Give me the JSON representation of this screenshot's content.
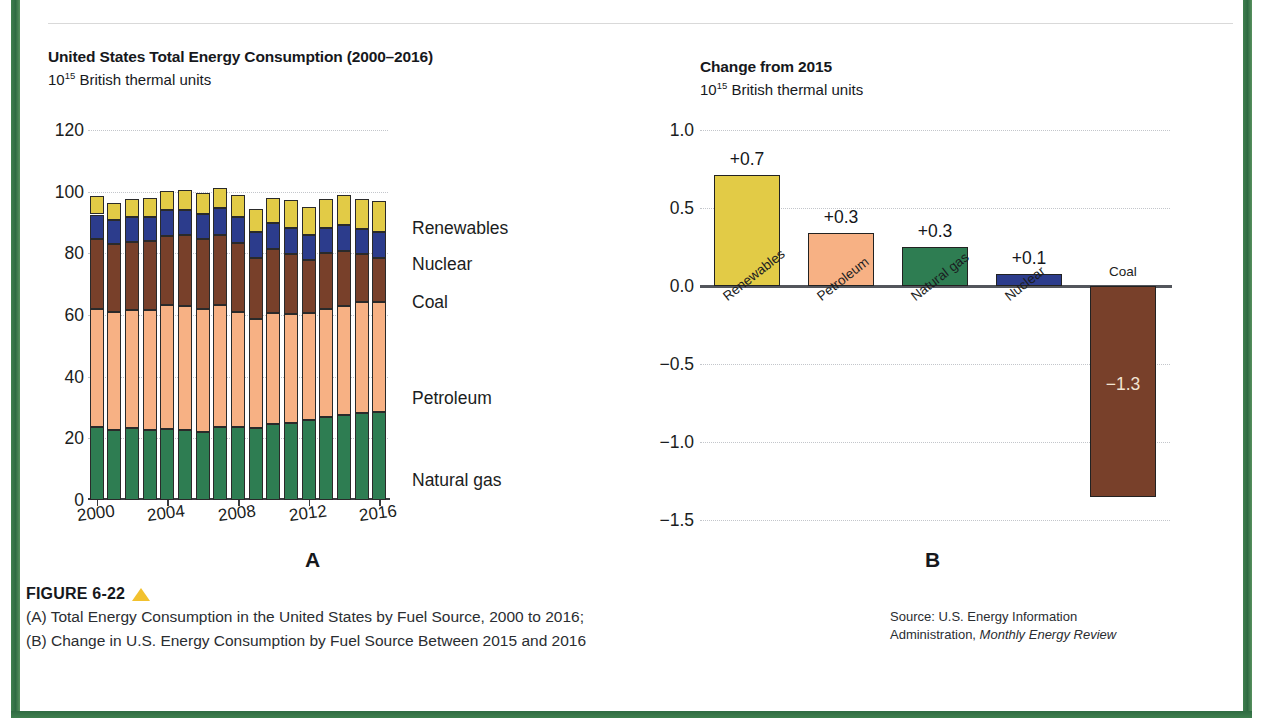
{
  "frame": {
    "border_color": "#2f6b42",
    "background": "#ffffff"
  },
  "top_partial_text": "",
  "panelA": {
    "title": "United States Total Energy Consumption (2000–2016)",
    "subtitle_prefix": "10",
    "subtitle_sup": "15",
    "subtitle_rest": " British thermal units",
    "letter": "A"
  },
  "panelB": {
    "title": "Change from 2015",
    "subtitle_prefix": "10",
    "subtitle_sup": "15",
    "subtitle_rest": " British thermal units",
    "letter": "B"
  },
  "caption": {
    "figure_label": "FIGURE 6-22",
    "triangle_color": "#f2c12e",
    "line_a": "(A) Total Energy Consumption in the United States by Fuel Source, 2000 to 2016;",
    "line_b": "(B) Change in U.S. Energy Consumption by Fuel Source Between 2015 and 2016",
    "source_line1": "Source: U.S. Energy Information",
    "source_line2_plain": "Administration, ",
    "source_line2_italic": "Monthly Energy Review"
  },
  "colors": {
    "renewables": "#E2CB46",
    "nuclear": "#2C3C8C",
    "coal": "#78402A",
    "petroleum": "#F7B184",
    "natural_gas": "#2E7D52",
    "grid": "#c3c6cb",
    "axis": "#3a3c40"
  },
  "chart_data": [
    {
      "type": "bar",
      "panel": "A",
      "stacked": true,
      "title": "United States Total Energy Consumption (2000–2016)",
      "subtitle": "10^15 British thermal units",
      "xlabel": "",
      "ylabel": "10^15 British thermal units",
      "ylim": [
        0,
        120
      ],
      "yticks": [
        0,
        20,
        40,
        60,
        80,
        100,
        120
      ],
      "ytick_labels": [
        "0",
        "20",
        "40",
        "60",
        "80",
        "100",
        "120"
      ],
      "grid": true,
      "legend_position": "right",
      "categories": [
        "2000",
        "2001",
        "2002",
        "2003",
        "2004",
        "2005",
        "2006",
        "2007",
        "2008",
        "2009",
        "2010",
        "2011",
        "2012",
        "2013",
        "2014",
        "2015",
        "2016"
      ],
      "xtick_labels": [
        "2000",
        "2004",
        "2008",
        "2012",
        "2016"
      ],
      "series": [
        {
          "name": "Natural gas",
          "color": "#2E7D52",
          "values": [
            23.8,
            22.8,
            23.5,
            22.8,
            22.9,
            22.6,
            22.2,
            23.6,
            23.8,
            23.4,
            24.6,
            24.9,
            26.1,
            26.9,
            27.5,
            28.2,
            28.4
          ]
        },
        {
          "name": "Petroleum",
          "color": "#F7B184",
          "values": [
            38.3,
            38.2,
            38.2,
            38.8,
            40.3,
            40.4,
            39.9,
            39.8,
            37.1,
            35.4,
            35.9,
            35.3,
            34.5,
            35.1,
            35.4,
            36.0,
            35.9
          ]
        },
        {
          "name": "Coal",
          "color": "#78402A",
          "values": [
            22.6,
            21.9,
            21.9,
            22.3,
            22.5,
            22.8,
            22.4,
            22.7,
            22.4,
            19.7,
            20.8,
            19.6,
            17.4,
            18.0,
            18.0,
            15.5,
            14.2
          ]
        },
        {
          "name": "Nuclear",
          "color": "#2C3C8C",
          "values": [
            7.9,
            8.0,
            8.1,
            7.9,
            8.2,
            8.2,
            8.2,
            8.5,
            8.4,
            8.4,
            8.4,
            8.3,
            8.1,
            8.2,
            8.3,
            8.3,
            8.4
          ]
        },
        {
          "name": "Renewables",
          "color": "#E2CB46",
          "values": [
            6.1,
            5.3,
            5.8,
            6.1,
            6.2,
            6.4,
            6.8,
            6.7,
            7.3,
            7.6,
            8.1,
            9.2,
            8.8,
            9.3,
            9.6,
            9.5,
            10.2
          ]
        }
      ],
      "legend_labels": [
        "Renewables",
        "Nuclear",
        "Coal",
        "Petroleum",
        "Natural gas"
      ]
    },
    {
      "type": "bar",
      "panel": "B",
      "stacked": false,
      "title": "Change from 2015",
      "subtitle": "10^15 British thermal units",
      "xlabel": "",
      "ylabel": "10^15 British thermal units",
      "ylim": [
        -1.5,
        1.0
      ],
      "yticks": [
        -1.5,
        -1.0,
        -0.5,
        0.0,
        0.5,
        1.0
      ],
      "ytick_labels": [
        "−1.5",
        "−1.0",
        "−0.5",
        "0.0",
        "0.5",
        "1.0"
      ],
      "grid": true,
      "categories": [
        "Renewables",
        "Petroleum",
        "Natural gas",
        "Nuclear",
        "Coal"
      ],
      "values": [
        0.71,
        0.34,
        0.25,
        0.08,
        -1.35
      ],
      "data_labels": [
        "+0.7",
        "+0.3",
        "+0.3",
        "+0.1",
        "−1.3"
      ],
      "bar_colors": [
        "#E2CB46",
        "#F7B184",
        "#2E7D52",
        "#2C3C8C",
        "#78402A"
      ]
    }
  ]
}
